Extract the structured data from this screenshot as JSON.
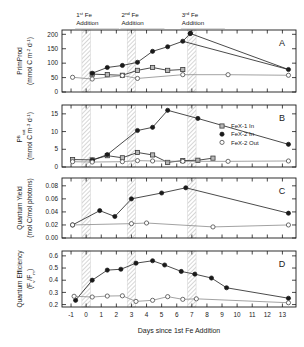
{
  "figure": {
    "x_axis_title": "Days since 1st Fe Addition",
    "x_ticks": [
      "-1",
      "0",
      "1",
      "2",
      "3",
      "4",
      "5",
      "6",
      "7",
      "8",
      "9",
      "10",
      "11",
      "12",
      "13"
    ],
    "annotations": [
      {
        "ordinal": "1",
        "suffix": "st",
        "line1": "Fe",
        "line2": "Addition",
        "day": 0
      },
      {
        "ordinal": "2",
        "suffix": "nd",
        "line1": "Fe",
        "line2": "Addition",
        "day": 3
      },
      {
        "ordinal": "3",
        "suffix": "rd",
        "line1": "Fe",
        "line2": "Addition",
        "day": 7
      }
    ],
    "legend": {
      "items": [
        {
          "label": "FeX-1 In",
          "marker": "square"
        },
        {
          "label": "FeX-2 In",
          "marker": "filled-circle"
        },
        {
          "label": "FeX-2 Out",
          "marker": "open-circle"
        }
      ]
    }
  },
  "chart_data": [
    {
      "type": "line",
      "panel": "A",
      "title": "",
      "ylabel": "PrimProd (mmol C m-2 d-1)",
      "ylabel_main": "PrimProd",
      "ylabel_units": "(mmol C m",
      "ylabel_exp1": "-2",
      "ylabel_mid": "d",
      "ylabel_exp2": "-1",
      "ylabel_close": ")",
      "xlabel": "Days since 1st Fe Addition",
      "ylim": [
        0,
        215
      ],
      "y_ticks": [
        "0",
        "50",
        "100",
        "150",
        "200"
      ],
      "y_tick_values": [
        0,
        50,
        100,
        150,
        200
      ],
      "xlim": [
        -1.5,
        13.8
      ],
      "grid": false,
      "series": [
        {
          "name": "FeX-1 In",
          "marker": "square",
          "x": [
            0.4,
            1.4,
            2.4,
            3.4,
            4.4,
            5.4,
            6.4
          ],
          "values": [
            62,
            60,
            58,
            75,
            85,
            75,
            78
          ]
        },
        {
          "name": "FeX-2 In",
          "marker": "filled-circle",
          "x": [
            0.4,
            1.4,
            2.4,
            3.4,
            4.4,
            5.4,
            6.4,
            13.4
          ],
          "values": [
            65,
            85,
            92,
            103,
            141,
            157,
            176,
            78
          ]
        },
        {
          "name": "FeX-2 In peak",
          "marker": "filled-circle",
          "x": [
            6.9
          ],
          "values": [
            203
          ]
        },
        {
          "name": "FeX-2 Out",
          "marker": "open-circle",
          "x": [
            -0.9,
            0.4,
            2.4,
            3.4,
            6.4,
            9.4,
            13.4
          ],
          "values": [
            51,
            45,
            57,
            47,
            60,
            60,
            58
          ]
        }
      ]
    },
    {
      "type": "line",
      "panel": "B",
      "ylabel": "Psat-B (mmol C m-3 d-1)",
      "ylabel_main": "P",
      "ylabel_sup": "B",
      "ylabel_sub": "sat",
      "ylabel_units": "(mmol C m",
      "ylabel_exp1": "-3",
      "ylabel_mid": "d",
      "ylabel_exp2": "-1",
      "ylabel_close": ")",
      "ylim": [
        0,
        17.5
      ],
      "y_ticks": [
        "0",
        "5",
        "10",
        "15"
      ],
      "y_tick_values": [
        0,
        5,
        10,
        15
      ],
      "grid": false,
      "series": [
        {
          "name": "FeX-1 In",
          "marker": "square",
          "x": [
            -0.9,
            0.4,
            1.4,
            2.4,
            3.4,
            4.4,
            5.4,
            6.4,
            7.4,
            8.4
          ],
          "values": [
            2.1,
            2.0,
            3.2,
            2.6,
            4.1,
            3.4,
            1.3,
            1.8,
            1.9,
            2.5
          ]
        },
        {
          "name": "FeX-2 In",
          "marker": "filled-circle",
          "x": [
            0.4,
            1.4,
            3.4,
            4.4,
            5.4,
            7.4,
            13.4
          ],
          "values": [
            1.9,
            3.5,
            10.3,
            11.2,
            16.0,
            13.7,
            6.4
          ]
        },
        {
          "name": "FeX-2 Out",
          "marker": "open-circle",
          "x": [
            -0.9,
            0.4,
            2.4,
            3.4,
            4.4,
            6.4,
            9.4,
            13.4
          ],
          "values": [
            1.5,
            1.4,
            1.5,
            1.8,
            1.7,
            1.6,
            1.6,
            1.7
          ]
        }
      ]
    },
    {
      "type": "line",
      "panel": "C",
      "ylabel": "Quantum Yield (mol C/mol photons)",
      "ylabel_main": "Quantum Yield",
      "ylabel_units": "(mol C/mol photons)",
      "ylim": [
        0.0,
        0.092
      ],
      "y_ticks": [
        "0.00",
        "0.02",
        "0.04",
        "0.06",
        "0.08"
      ],
      "y_tick_values": [
        0.0,
        0.02,
        0.04,
        0.06,
        0.08
      ],
      "grid": false,
      "series": [
        {
          "name": "FeX-2 In",
          "marker": "filled-circle",
          "x": [
            -0.9,
            0.9,
            1.9,
            3.0,
            5.0,
            6.6,
            13.4
          ],
          "values": [
            0.02,
            0.042,
            0.033,
            0.06,
            0.069,
            0.077,
            0.038
          ]
        },
        {
          "name": "FeX-2 Out",
          "marker": "open-circle",
          "x": [
            -0.9,
            3.0,
            4.0,
            8.4,
            13.4
          ],
          "values": [
            0.02,
            0.022,
            0.023,
            0.017,
            0.02
          ]
        }
      ]
    },
    {
      "type": "line",
      "panel": "D",
      "ylabel": "Quantum Efficiency (Fv/Fm)",
      "ylabel_main": "Quantum Efficiency",
      "ylabel_f": "F",
      "ylabel_v": "v",
      "ylabel_m": "m",
      "ylim": [
        0.18,
        0.64
      ],
      "y_ticks": [
        "0.2",
        "0.3",
        "0.4",
        "0.5",
        "0.6"
      ],
      "y_tick_values": [
        0.2,
        0.3,
        0.4,
        0.5,
        0.6
      ],
      "grid": false,
      "series": [
        {
          "name": "FeX-2 In",
          "marker": "filled-circle",
          "x": [
            -0.7,
            0.4,
            1.4,
            2.3,
            3.3,
            4.4,
            5.2,
            6.3,
            7.2,
            8.3,
            9.3,
            13.4
          ],
          "values": [
            0.235,
            0.4,
            0.483,
            0.49,
            0.54,
            0.56,
            0.525,
            0.472,
            0.45,
            0.418,
            0.338,
            0.252
          ]
        },
        {
          "name": "FeX-2 Out",
          "marker": "open-circle",
          "x": [
            -0.8,
            0.4,
            1.4,
            2.4,
            3.3,
            4.4,
            5.4,
            6.4,
            7.3,
            13.4
          ],
          "values": [
            0.268,
            0.262,
            0.27,
            0.272,
            0.226,
            0.235,
            0.265,
            0.243,
            0.247,
            0.215
          ]
        }
      ]
    }
  ]
}
